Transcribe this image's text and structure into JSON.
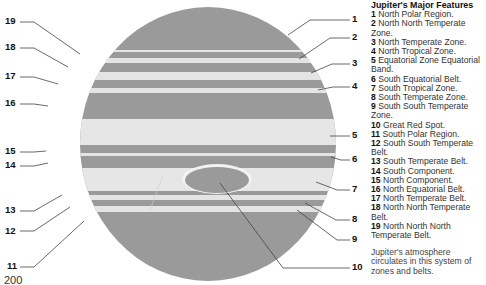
{
  "legend": {
    "title": "Jupiter's Major Features",
    "items": [
      {
        "num": "1",
        "text": "North Polar Region."
      },
      {
        "num": "2",
        "text": "North North Temperate Zone."
      },
      {
        "num": "3",
        "text": "North Temperate Zone."
      },
      {
        "num": "4",
        "text": "North Tropical Zone."
      },
      {
        "num": "5",
        "text": "Equatorial Zone Equatorial Band."
      },
      {
        "num": "6",
        "text": "South Equatorial Belt."
      },
      {
        "num": "7",
        "text": "South Tropical Zone."
      },
      {
        "num": "8",
        "text": "South Temperate Zone."
      },
      {
        "num": "9",
        "text": "South South Temperate Zone."
      },
      {
        "num": "10",
        "text": "Great Red Spot."
      },
      {
        "num": "11",
        "text": "South Polar Region."
      },
      {
        "num": "12",
        "text": "South South Temperate Belt."
      },
      {
        "num": "13",
        "text": "South Temperate Belt."
      },
      {
        "num": "14",
        "text": "South Component."
      },
      {
        "num": "15",
        "text": "North Component."
      },
      {
        "num": "16",
        "text": "North Equatorial Belt."
      },
      {
        "num": "17",
        "text": "North Temperate Belt."
      },
      {
        "num": "18",
        "text": "North North Temperate Belt."
      },
      {
        "num": "19",
        "text": "North North North Temperate Belt."
      }
    ],
    "note": "Jupiter's atmosphere circulates in this system of zones and belts."
  },
  "callouts": {
    "right": [
      {
        "num": "1",
        "y": 18
      },
      {
        "num": "2",
        "y": 35
      },
      {
        "num": "3",
        "y": 62
      },
      {
        "num": "4",
        "y": 85
      },
      {
        "num": "5",
        "y": 134
      },
      {
        "num": "6",
        "y": 158
      },
      {
        "num": "7",
        "y": 188
      },
      {
        "num": "8",
        "y": 218
      },
      {
        "num": "9",
        "y": 238
      },
      {
        "num": "10",
        "y": 266
      }
    ],
    "left": [
      {
        "num": "19",
        "y": 20
      },
      {
        "num": "18",
        "y": 46
      },
      {
        "num": "17",
        "y": 75
      },
      {
        "num": "16",
        "y": 102
      },
      {
        "num": "15",
        "y": 150
      },
      {
        "num": "14",
        "y": 164
      },
      {
        "num": "13",
        "y": 209
      },
      {
        "num": "12",
        "y": 230
      },
      {
        "num": "11",
        "y": 265
      }
    ]
  },
  "colors": {
    "belt": "#9a9a9a",
    "zone": "#e4e4e4",
    "line": "#444444"
  },
  "page_number": "200"
}
